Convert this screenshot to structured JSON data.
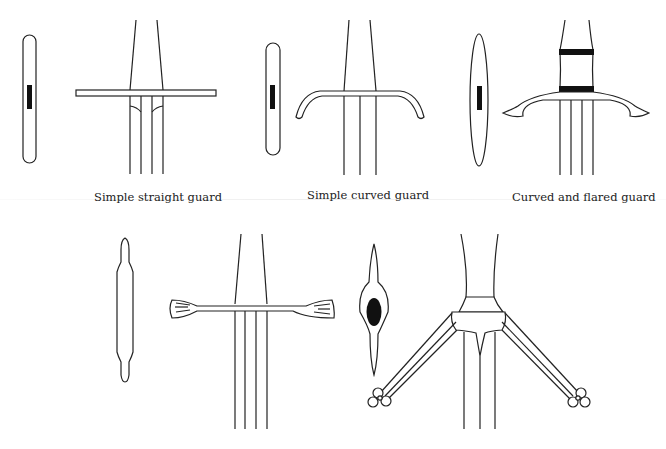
{
  "figure": {
    "panels": [
      {
        "id": "straight",
        "caption": "Simple straight guard"
      },
      {
        "id": "curved",
        "caption": "Simple curved guard"
      },
      {
        "id": "flared",
        "caption": "Curved and flared guard"
      },
      {
        "id": "flared-ends",
        "caption": ""
      },
      {
        "id": "ring-quillons",
        "caption": ""
      }
    ]
  }
}
